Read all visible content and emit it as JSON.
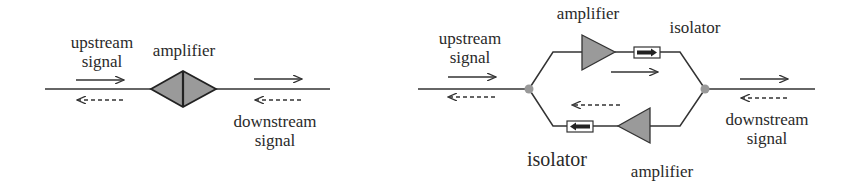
{
  "left_diagram": {
    "upstream_label": [
      "upstream",
      "signal"
    ],
    "amplifier_label": "amplifier",
    "downstream_label": [
      "downstream",
      "signal"
    ]
  },
  "right_diagram": {
    "upstream_label": [
      "upstream",
      "signal"
    ],
    "top_amplifier_label": "amplifier",
    "top_isolator_label": "isolator",
    "bottom_isolator_label": "isolator",
    "bottom_amplifier_label": "amplifier",
    "downstream_label": [
      "downstream",
      "signal"
    ]
  },
  "colors": {
    "line": "#333333",
    "fill": "#999999",
    "node": "#999999"
  }
}
